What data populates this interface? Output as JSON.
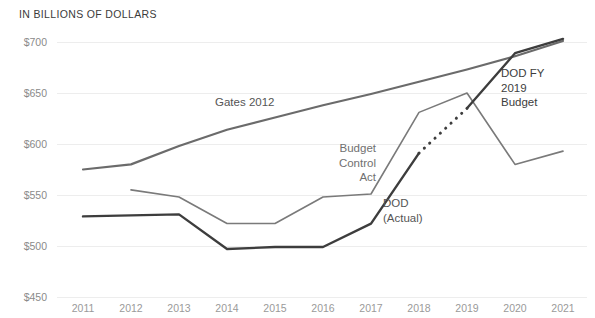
{
  "chart_data": {
    "type": "line",
    "title": "IN BILLIONS OF DOLLARS",
    "xlabel": "",
    "ylabel": "",
    "ylim": [
      450,
      700
    ],
    "yticks": [
      450,
      500,
      550,
      600,
      650,
      700
    ],
    "ytick_labels": [
      "$450",
      "$500",
      "$550",
      "$600",
      "$650",
      "$700"
    ],
    "grid": true,
    "legend_position": "inline-annotations",
    "categories": [
      "2011",
      "2012",
      "2013",
      "2014",
      "2015",
      "2016",
      "2017",
      "2018",
      "2019",
      "2020",
      "2021"
    ],
    "x": [
      2011,
      2012,
      2013,
      2014,
      2015,
      2016,
      2017,
      2018,
      2019,
      2020,
      2021
    ],
    "series": [
      {
        "name": "Gates 2012",
        "color": "#6b6b6b",
        "width": 2.2,
        "style": "solid",
        "x": [
          2011,
          2012,
          2013,
          2014,
          2015,
          2016,
          2017,
          2018,
          2019,
          2020,
          2021
        ],
        "values": [
          575,
          580,
          598,
          614,
          626,
          638,
          649,
          661,
          673,
          686,
          701
        ]
      },
      {
        "name": "Budget Control Act",
        "color": "#7a7a7a",
        "width": 1.6,
        "style": "solid",
        "x": [
          2012,
          2013,
          2014,
          2015,
          2016,
          2017,
          2018,
          2019,
          2020,
          2021
        ],
        "values": [
          555,
          548,
          522,
          522,
          548,
          551,
          631,
          650,
          580,
          593
        ]
      },
      {
        "name": "DOD (Actual)",
        "color": "#3d3d3d",
        "width": 2.4,
        "style": "solid",
        "x": [
          2011,
          2012,
          2013,
          2014,
          2015,
          2016,
          2017,
          2018
        ],
        "values": [
          529,
          530,
          531,
          497,
          499,
          499,
          522,
          591
        ]
      },
      {
        "name": "DOD FY 2019 Budget (projection)",
        "color": "#3d3d3d",
        "width": 2.6,
        "style": "dotted",
        "x": [
          2018,
          2019
        ],
        "values": [
          591,
          635
        ]
      },
      {
        "name": "DOD FY 2019 Budget",
        "color": "#3d3d3d",
        "width": 2.4,
        "style": "solid",
        "x": [
          2019,
          2020,
          2021
        ],
        "values": [
          635,
          689,
          703
        ]
      }
    ],
    "annotations": [
      {
        "id": "gates-2012",
        "text": "Gates 2012",
        "x": 215,
        "y": 106,
        "anchor": "start",
        "color": "#555555",
        "lines": [
          "Gates 2012"
        ]
      },
      {
        "id": "budget-control-act",
        "text": "Budget Control Act",
        "x": 376,
        "y": 152,
        "anchor": "end",
        "color": "#707070",
        "lines": [
          "Budget",
          "Control",
          "Act"
        ]
      },
      {
        "id": "dod-actual",
        "text": "DOD (Actual)",
        "x": 383,
        "y": 207,
        "anchor": "start",
        "color": "#555555",
        "lines": [
          "DOD",
          "(Actual)"
        ]
      },
      {
        "id": "dod-fy-2019-budget",
        "text": "DOD FY 2019 Budget",
        "x": 501,
        "y": 77,
        "anchor": "start",
        "color": "#3d3d3d",
        "lines": [
          "DOD FY",
          "2019",
          "Budget"
        ]
      }
    ]
  },
  "plot_geometry": {
    "left": 57,
    "right": 587,
    "top": 42,
    "bottom": 297,
    "first_x": 83,
    "last_x": 563
  }
}
